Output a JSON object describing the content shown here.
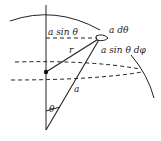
{
  "diagram": {
    "type": "spherical-coordinates-area-element",
    "labels": {
      "ring_radius": "a sin θ",
      "arc_theta": "a dθ",
      "arc_phi": "a sin θ dφ",
      "field_distance": "r",
      "sphere_radius": "a",
      "polar_angle": "θ"
    },
    "colors": {
      "stroke": "#222222",
      "background": "#ffffff"
    }
  }
}
